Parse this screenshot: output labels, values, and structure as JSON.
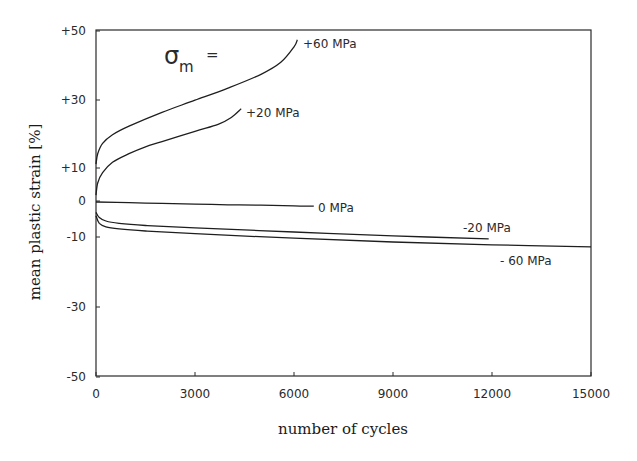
{
  "chart_data": {
    "type": "line",
    "title": "",
    "annotation": "σm =",
    "annotation_symbol": "σ",
    "annotation_subscript": "m",
    "annotation_suffix": "=",
    "xlabel": "number of cycles",
    "ylabel": "mean plastic strain [%]",
    "xlim": [
      0,
      15000
    ],
    "ylim": [
      -50,
      50
    ],
    "x_ticks": [
      0,
      3000,
      6000,
      9000,
      12000,
      15000
    ],
    "x_tick_labels": [
      "0",
      "3000",
      "6000",
      "9000",
      "12000",
      "15000"
    ],
    "y_ticks": [
      50,
      30,
      10,
      0,
      -10,
      -30,
      -50
    ],
    "y_tick_labels": [
      "+50",
      "+30",
      "+10",
      "0",
      "-10",
      "-30",
      "-50"
    ],
    "grid": false,
    "legend_position": "inline labels at curve ends",
    "series": [
      {
        "name": "+60 MPa",
        "x": [
          0,
          50,
          200,
          500,
          1000,
          2000,
          3000,
          4000,
          5000,
          5600,
          6000,
          6100
        ],
        "y": [
          11,
          14,
          17,
          19.5,
          22,
          26,
          29.5,
          33,
          37,
          40.5,
          45,
          47
        ]
      },
      {
        "name": "+20 MPa",
        "x": [
          0,
          50,
          200,
          500,
          1000,
          1500,
          2000,
          3000,
          3700,
          4100,
          4400
        ],
        "y": [
          2,
          5.5,
          8.5,
          11.5,
          14,
          16,
          17.5,
          20.5,
          22.5,
          24.5,
          27
        ]
      },
      {
        "name": "0 MPa",
        "x": [
          0,
          1000,
          2000,
          3000,
          4000,
          5000,
          6000,
          6600
        ],
        "y": [
          0,
          -0.2,
          -0.4,
          -0.6,
          -0.8,
          -0.9,
          -1.1,
          -1.2
        ]
      },
      {
        "name": "-20 MPa",
        "x": [
          0,
          100,
          300,
          700,
          1500,
          3000,
          6000,
          9000,
          11900
        ],
        "y": [
          -3,
          -4.5,
          -5.5,
          -6.2,
          -6.8,
          -7.5,
          -8.7,
          -9.8,
          -10.7
        ]
      },
      {
        "name": "-60 MPa",
        "x": [
          0,
          100,
          300,
          700,
          1500,
          3000,
          6000,
          9000,
          12000,
          15000
        ],
        "y": [
          -4,
          -6.2,
          -7.2,
          -7.8,
          -8.4,
          -9.2,
          -10.5,
          -11.6,
          -12.4,
          -13
        ]
      }
    ]
  },
  "labels": {
    "series_0": "+60 MPa",
    "series_1": "+20 MPa",
    "series_2": "0 MPa",
    "series_3": "-20 MPa",
    "series_4": "- 60 MPa"
  }
}
